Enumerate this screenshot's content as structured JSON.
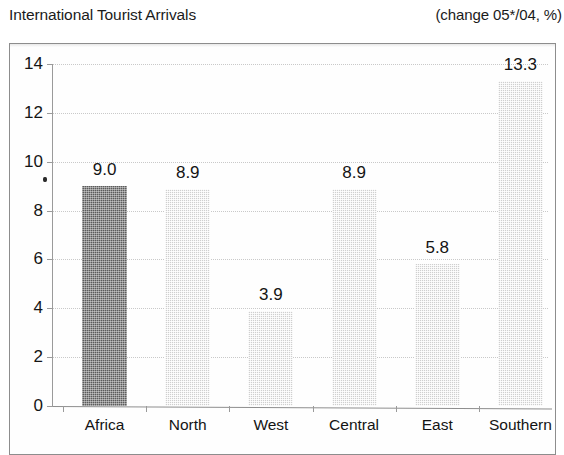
{
  "header": {
    "title": "International Tourist Arrivals",
    "units": "(change 05*/04, %)"
  },
  "chart_data": {
    "type": "bar",
    "title": "International Tourist Arrivals",
    "subtitle": "(change 05*/04, %)",
    "xlabel": "",
    "ylabel": "",
    "categories": [
      "Africa",
      "North",
      "West",
      "Central",
      "East",
      "Southern"
    ],
    "values": [
      9.0,
      8.9,
      3.9,
      8.9,
      5.8,
      13.3
    ],
    "data_labels": [
      "9.0",
      "8.9",
      "3.9",
      "8.9",
      "5.8",
      "13.3"
    ],
    "ylim": [
      0,
      14
    ],
    "yticks": [
      0,
      2,
      4,
      6,
      8,
      10,
      12,
      14
    ],
    "ytick_labels": [
      "0",
      "2",
      "4",
      "6",
      "8",
      "10",
      "12",
      "14"
    ],
    "grid": true,
    "legend": "none",
    "series": [
      {
        "name": "change 05*/04, %",
        "values": [
          9.0,
          8.9,
          3.9,
          8.9,
          5.8,
          13.3
        ],
        "bar_colors": [
          "#5b5b5b",
          "#cfcfcf",
          "#cfcfcf",
          "#cfcfcf",
          "#cfcfcf",
          "#cfcfcf"
        ]
      }
    ],
    "colors": {
      "highlight_bar": "#5b5b5b",
      "bar": "#cfcfcf",
      "gridline": "#c9c9c9",
      "axis": "#8e8e8e",
      "frame": "#8d8d8d",
      "text": "#141414",
      "background": "#ffffff"
    }
  }
}
